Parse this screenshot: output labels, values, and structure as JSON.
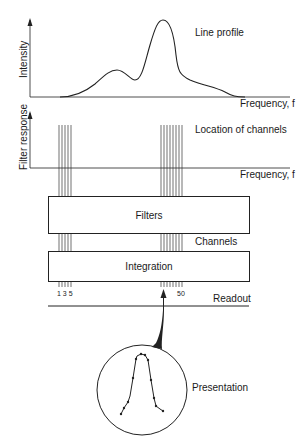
{
  "diagram": {
    "top_plot": {
      "y_axis_label": "Intensity",
      "x_axis_label": "Frequency, f",
      "title": "Line profile"
    },
    "filter_plot": {
      "y_axis_label": "Filter response",
      "x_axis_label": "Frequency, f",
      "annotation": "Location of channels"
    },
    "blocks": {
      "filters": "Filters",
      "channels": "Channels",
      "integration": "Integration",
      "readout": "Readout"
    },
    "channel_numbers": {
      "left": "1 3 5",
      "right": "50"
    },
    "presentation": {
      "label": "Presentation"
    },
    "channel_groups": {
      "left_count": 5,
      "right_count": 9
    }
  }
}
